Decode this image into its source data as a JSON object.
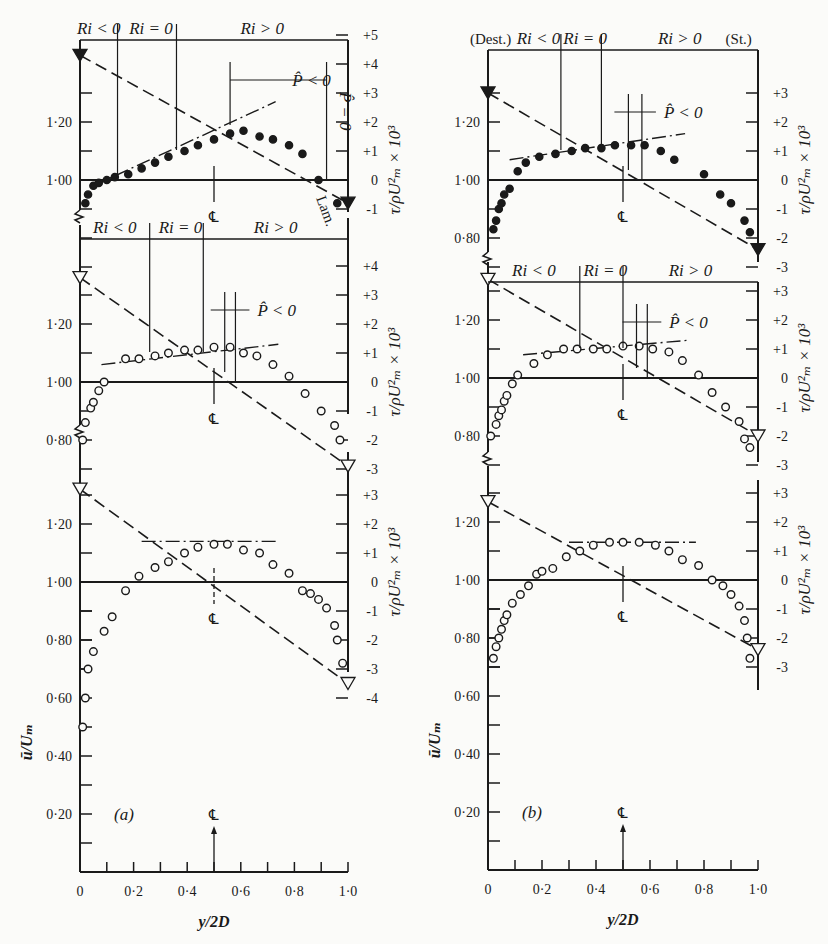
{
  "figure": {
    "panel_a_label": "(a)",
    "panel_b_label": "(b)",
    "xlabel": "y/2D",
    "ylabel_left": "ū/Uₘ",
    "ylabel_right": "τ/ρU²ₘ × 10³",
    "centerline_label": "℄",
    "destabilizing_label": "(Dest.)",
    "stabilizing_label": "(St.)",
    "ri_neg": "Ri < 0",
    "ri_zero": "Ri = 0",
    "ri_pos": "Ri > 0",
    "p_neg": "P̂ < 0",
    "p_zero": "P̂ = 0",
    "lam_label": "Lam.",
    "x_ticks": [
      "0",
      "0·2",
      "0·4",
      "0·6",
      "0·8",
      "1·0"
    ],
    "y_ticks_bottom": [
      "0·20",
      "0·40",
      "0·60",
      "0·80",
      "1·00",
      "1·20"
    ],
    "y_ticks_upper": [
      "0·80",
      "1·00",
      "1·20"
    ]
  },
  "chart_data": [
    {
      "type": "scatter",
      "panel": "a",
      "subplot": "top",
      "title": "Ri regions: Ri<0, Ri=0, Ri>0",
      "xlabel": "y/2D",
      "ylabel": "ū/Uₘ",
      "ylabel_right": "τ/ρU²ₘ × 10³",
      "right_ticks": [
        "-1",
        "0",
        "+1",
        "+2",
        "+3",
        "+4",
        "+5"
      ],
      "marker": "filled",
      "x": [
        0.02,
        0.03,
        0.05,
        0.07,
        0.1,
        0.13,
        0.18,
        0.23,
        0.28,
        0.33,
        0.39,
        0.44,
        0.5,
        0.56,
        0.61,
        0.67,
        0.72,
        0.78,
        0.83,
        0.89,
        0.96
      ],
      "u": [
        0.92,
        0.95,
        0.98,
        0.99,
        1.0,
        1.01,
        1.02,
        1.04,
        1.06,
        1.08,
        1.1,
        1.12,
        1.14,
        1.16,
        1.17,
        1.15,
        1.14,
        1.12,
        1.09,
        1.0,
        0.92
      ],
      "shear_line": {
        "x": [
          0.0,
          1.0
        ],
        "tau": [
          4.3,
          -0.8
        ]
      },
      "gradient_line": {
        "x": [
          0.05,
          0.73
        ],
        "u": [
          0.98,
          1.27
        ]
      },
      "ri_bounds": [
        0.14,
        0.36
      ],
      "p_neg_range": [
        0.56,
        0.92
      ]
    },
    {
      "type": "scatter",
      "panel": "a",
      "subplot": "middle",
      "right_ticks": [
        "-3",
        "-2",
        "-1",
        "0",
        "+1",
        "+2",
        "+3",
        "+4"
      ],
      "marker": "open",
      "x": [
        0.01,
        0.02,
        0.04,
        0.05,
        0.07,
        0.09,
        0.17,
        0.22,
        0.28,
        0.33,
        0.39,
        0.44,
        0.5,
        0.56,
        0.61,
        0.66,
        0.72,
        0.78,
        0.84,
        0.9,
        0.95,
        0.97
      ],
      "u": [
        0.8,
        0.86,
        0.91,
        0.93,
        0.97,
        1.0,
        1.08,
        1.08,
        1.09,
        1.1,
        1.11,
        1.11,
        1.12,
        1.12,
        1.1,
        1.09,
        1.06,
        1.02,
        0.96,
        0.9,
        0.85,
        0.8
      ],
      "shear_line": {
        "x": [
          0.0,
          1.0
        ],
        "tau": [
          3.6,
          -2.9
        ]
      },
      "gradient_line": {
        "x": [
          0.08,
          0.74
        ],
        "u": [
          1.06,
          1.13
        ]
      },
      "ri_bounds": [
        0.26,
        0.46
      ],
      "p_neg_range": [
        0.54,
        0.58
      ]
    },
    {
      "type": "scatter",
      "panel": "a",
      "subplot": "bottom",
      "right_ticks": [
        "-4",
        "-3",
        "-2",
        "-1",
        "0",
        "+1",
        "+2",
        "+3"
      ],
      "marker": "open",
      "x": [
        0.01,
        0.02,
        0.03,
        0.05,
        0.09,
        0.12,
        0.17,
        0.22,
        0.28,
        0.33,
        0.39,
        0.44,
        0.5,
        0.55,
        0.61,
        0.67,
        0.72,
        0.78,
        0.83,
        0.86,
        0.89,
        0.92,
        0.95,
        0.96,
        0.98
      ],
      "u": [
        0.5,
        0.6,
        0.7,
        0.76,
        0.83,
        0.88,
        0.97,
        1.02,
        1.05,
        1.07,
        1.1,
        1.12,
        1.13,
        1.13,
        1.11,
        1.1,
        1.06,
        1.03,
        0.97,
        0.96,
        0.94,
        0.91,
        0.85,
        0.8,
        0.72
      ],
      "shear_line": {
        "x": [
          0.0,
          1.0
        ],
        "tau": [
          3.2,
          -3.5
        ]
      },
      "gradient_line": {
        "x": [
          0.23,
          0.73
        ],
        "u": [
          1.14,
          1.14
        ]
      }
    },
    {
      "type": "scatter",
      "panel": "b",
      "subplot": "top",
      "title": "(Dest.) Ri<0, Ri=0, Ri>0 (St.)",
      "right_ticks": [
        "-3",
        "-2",
        "-1",
        "0",
        "+1",
        "+2",
        "+3"
      ],
      "marker": "filled",
      "x": [
        0.02,
        0.03,
        0.04,
        0.05,
        0.06,
        0.08,
        0.11,
        0.14,
        0.19,
        0.25,
        0.31,
        0.36,
        0.42,
        0.47,
        0.53,
        0.58,
        0.64,
        0.69,
        0.8,
        0.86,
        0.9,
        0.95,
        0.97
      ],
      "u": [
        0.83,
        0.86,
        0.9,
        0.92,
        0.95,
        0.97,
        1.03,
        1.06,
        1.08,
        1.09,
        1.1,
        1.11,
        1.11,
        1.12,
        1.12,
        1.12,
        1.1,
        1.07,
        1.02,
        0.95,
        0.92,
        0.86,
        0.82
      ],
      "shear_line": {
        "x": [
          0.0,
          1.0
        ],
        "tau": [
          3.0,
          -2.4
        ]
      },
      "gradient_line": {
        "x": [
          0.08,
          0.73
        ],
        "u": [
          1.07,
          1.16
        ]
      },
      "ri_bounds": [
        0.27,
        0.42
      ],
      "p_neg_range": [
        0.52,
        0.57
      ]
    },
    {
      "type": "scatter",
      "panel": "b",
      "subplot": "middle",
      "right_ticks": [
        "-3",
        "-2",
        "-1",
        "0",
        "+1",
        "+2",
        "+3"
      ],
      "marker": "open",
      "x": [
        0.01,
        0.03,
        0.04,
        0.05,
        0.06,
        0.07,
        0.09,
        0.11,
        0.17,
        0.22,
        0.28,
        0.33,
        0.39,
        0.44,
        0.5,
        0.56,
        0.61,
        0.67,
        0.72,
        0.78,
        0.83,
        0.88,
        0.93,
        0.95,
        0.97
      ],
      "u": [
        0.8,
        0.84,
        0.87,
        0.89,
        0.92,
        0.94,
        0.98,
        1.01,
        1.05,
        1.08,
        1.1,
        1.1,
        1.1,
        1.1,
        1.11,
        1.11,
        1.1,
        1.09,
        1.06,
        1.01,
        0.95,
        0.9,
        0.85,
        0.79,
        0.76
      ],
      "shear_line": {
        "x": [
          0.0,
          1.0
        ],
        "tau": [
          3.4,
          -2.0
        ]
      },
      "gradient_line": {
        "x": [
          0.13,
          0.74
        ],
        "u": [
          1.08,
          1.13
        ]
      },
      "ri_bounds": [
        0.34,
        0.5
      ],
      "p_neg_range": [
        0.55,
        0.59
      ]
    },
    {
      "type": "scatter",
      "panel": "b",
      "subplot": "bottom",
      "right_ticks": [
        "-3",
        "-2",
        "-1",
        "0",
        "+1",
        "+2",
        "+3"
      ],
      "marker": "open",
      "x": [
        0.02,
        0.03,
        0.04,
        0.05,
        0.06,
        0.07,
        0.09,
        0.12,
        0.15,
        0.18,
        0.2,
        0.24,
        0.29,
        0.34,
        0.39,
        0.45,
        0.5,
        0.56,
        0.62,
        0.67,
        0.72,
        0.78,
        0.83,
        0.87,
        0.9,
        0.93,
        0.95,
        0.96,
        0.97
      ],
      "u": [
        0.73,
        0.77,
        0.8,
        0.83,
        0.86,
        0.88,
        0.92,
        0.95,
        0.98,
        1.02,
        1.03,
        1.04,
        1.08,
        1.1,
        1.12,
        1.13,
        1.13,
        1.13,
        1.12,
        1.1,
        1.07,
        1.05,
        1.0,
        0.98,
        0.95,
        0.91,
        0.86,
        0.8,
        0.73
      ],
      "shear_line": {
        "x": [
          0.0,
          1.0
        ],
        "tau": [
          2.7,
          -2.4
        ]
      },
      "gradient_line": {
        "x": [
          0.3,
          0.77
        ],
        "u": [
          1.13,
          1.13
        ]
      }
    }
  ]
}
